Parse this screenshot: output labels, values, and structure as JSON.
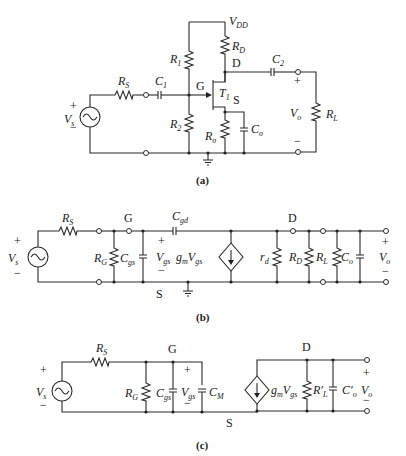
{
  "figure": {
    "panels": [
      {
        "id": "a",
        "caption": "(a)",
        "description": "Common-source JFET amplifier with voltage-divider bias",
        "labels": {
          "vdd": "V",
          "vdd_sub": "DD",
          "r1": "R",
          "r1_sub": "1",
          "r2": "R",
          "r2_sub": "2",
          "rd": "R",
          "rd_sub": "D",
          "rs": "R",
          "rs_sub": "S",
          "rsig": "R",
          "rsig_sub": "σ",
          "csig": "C",
          "csig_sub": "σ",
          "c1": "C",
          "c1_sub": "1",
          "c2": "C",
          "c2_sub": "2",
          "rl": "R",
          "rl_sub": "L",
          "t1": "T",
          "t1_sub": "1",
          "gate": "G",
          "drain": "D",
          "source": "S",
          "vs": "V",
          "vs_sub": "s",
          "vo": "V",
          "vo_sub": "o",
          "plus": "+",
          "minus": "−"
        }
      },
      {
        "id": "b",
        "caption": "(b)",
        "description": "High-frequency small-signal equivalent circuit",
        "labels": {
          "rs": "R",
          "rs_sub": "S",
          "rg": "R",
          "rg_sub": "G",
          "cgs": "C",
          "cgs_sub": "gs",
          "cgd": "C",
          "cgd_sub": "gd",
          "vgs": "V",
          "vgs_sub": "gs",
          "gm": "g",
          "gm_sub": "m",
          "gm_v": "V",
          "gm_v_sub": "gs",
          "rd_small": "r",
          "rd_small_sub": "d",
          "rd": "R",
          "rd_sub": "D",
          "rl": "R",
          "rl_sub": "L",
          "co": "C",
          "co_sub": "o",
          "vs": "V",
          "vs_sub": "s",
          "vo": "V",
          "vo_sub": "o",
          "gate": "G",
          "drain": "D",
          "source": "S",
          "plus": "+",
          "minus": "−"
        }
      },
      {
        "id": "c",
        "caption": "(c)",
        "description": "Equivalent circuit with Miller capacitance",
        "labels": {
          "rs": "R",
          "rs_sub": "S",
          "rg": "R",
          "rg_sub": "G",
          "cgs": "C",
          "cgs_sub": "gs",
          "vgs": "V",
          "vgs_sub": "gs",
          "cm": "C",
          "cm_sub": "M",
          "gm": "g",
          "gm_sub": "m",
          "gm_v": "V",
          "gm_v_sub": "gs",
          "rlp": "R′",
          "rlp_sub": "L",
          "co": "C′",
          "co_sub": "o",
          "vs": "V",
          "vs_sub": "s",
          "vo": "V",
          "vo_sub": "o",
          "gate": "G",
          "drain": "D",
          "source": "S",
          "plus": "+",
          "minus": "−"
        }
      }
    ]
  }
}
